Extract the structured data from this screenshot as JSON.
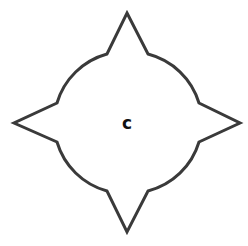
{
  "diagram": {
    "shape": "four-point-star-circle",
    "center_label": "c",
    "stroke_color": "#3a3a3a",
    "fill_color": "#ffffff",
    "label_color": "#111111"
  }
}
